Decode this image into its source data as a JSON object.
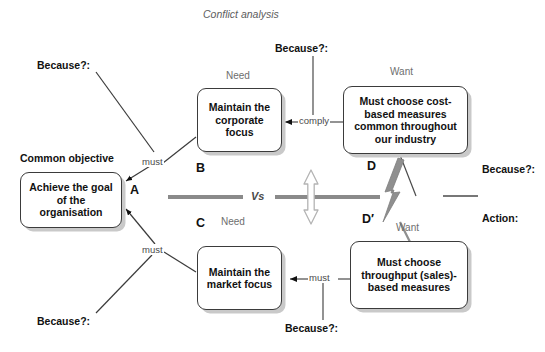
{
  "diagram": {
    "title": "Conflict analysis",
    "vs_label": "Vs",
    "nodes": {
      "a": {
        "letter": "A",
        "caption": "Common objective",
        "text": "Achieve the goal of the organisation"
      },
      "b": {
        "letter": "B",
        "caption": "Need",
        "text": "Maintain the corporate focus"
      },
      "c": {
        "letter": "C",
        "caption": "Need",
        "text": "Maintain the market focus"
      },
      "d": {
        "letter": "D",
        "caption": "Want",
        "text": "Must choose cost-based measures common throughout our industry"
      },
      "dprime": {
        "letter": "D′",
        "caption": "Want",
        "text": "Must choose throughput (sales)-based measures"
      }
    },
    "connectors": {
      "a_b": "must",
      "a_c": "must",
      "b_d": "comply",
      "c_dprime": "must"
    },
    "assumption_prompts": {
      "top_left": "Because?:",
      "top_center": "Because?:",
      "bottom_left": "Because?:",
      "bottom_center": "Because?:",
      "right_upper": "Because?:",
      "right_lower_action": "Action:"
    },
    "colors": {
      "node_border": "#3b3b3b",
      "node_shadow": "#c9c9c9",
      "vs_bar": "#8a8a8a",
      "conflict_bolt": "#8f8f8f",
      "connector_line": "#4a4a4a",
      "caption_text": "#6e6e6e",
      "title_text": "#5d5d5d"
    }
  }
}
